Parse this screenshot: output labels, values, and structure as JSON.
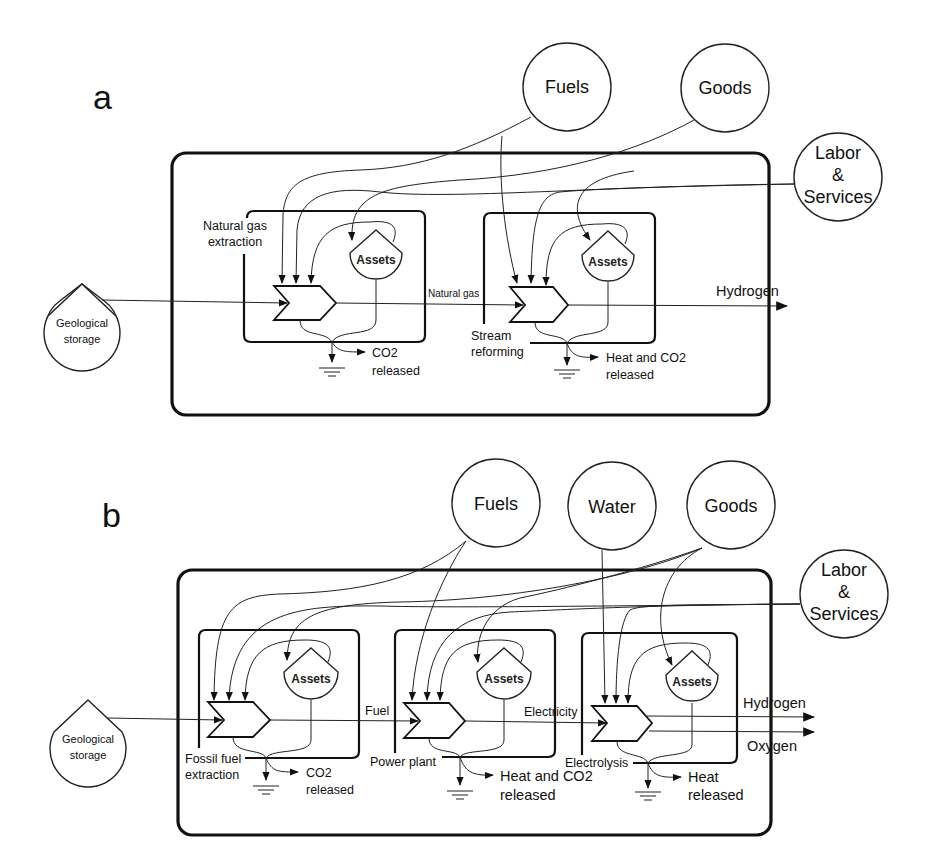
{
  "figure": {
    "panels": [
      {
        "letter": "a",
        "sources": {
          "fuels": "Fuels",
          "goods": "Goods",
          "labor_line1": "Labor",
          "labor_line2": "&",
          "labor_line3": "Services"
        },
        "geological": {
          "line1": "Geological",
          "line2": "storage"
        },
        "processes": [
          {
            "name_line1": "Natural gas",
            "name_line2": "extraction",
            "asset_label": "Assets",
            "emission_line1": "CO2",
            "emission_line2": "released"
          },
          {
            "name_line1": "Stream",
            "name_line2": "reforming",
            "asset_label": "Assets",
            "emission_line1": "Heat and CO2",
            "emission_line2": "released"
          }
        ],
        "flows": {
          "intermediate": "Natural gas",
          "output": "Hydrogen"
        }
      },
      {
        "letter": "b",
        "sources": {
          "fuels": "Fuels",
          "water": "Water",
          "goods": "Goods",
          "labor_line1": "Labor",
          "labor_line2": "&",
          "labor_line3": "Services"
        },
        "geological": {
          "line1": "Geological",
          "line2": "storage"
        },
        "processes": [
          {
            "name_line1": "Fossil fuel",
            "name_line2": "extraction",
            "asset_label": "Assets",
            "emission_line1": "CO2",
            "emission_line2": "released"
          },
          {
            "name_line1": "Power plant",
            "asset_label": "Assets",
            "emission_line1": "Heat and CO2",
            "emission_line2": "released"
          },
          {
            "name_line1": "Electrolysis",
            "asset_label": "Assets",
            "emission_line1": "Heat",
            "emission_line2": "released"
          }
        ],
        "flows": {
          "intermediate_1": "Fuel",
          "intermediate_2": "Electricity",
          "output_1": "Hydrogen",
          "output_2": "Oxygen"
        }
      }
    ]
  }
}
